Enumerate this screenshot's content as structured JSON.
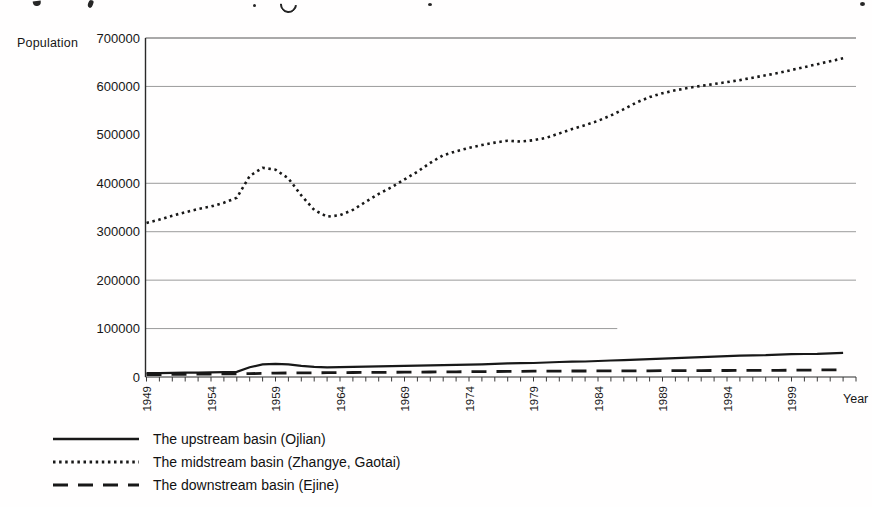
{
  "chart_data": {
    "type": "line",
    "title": "",
    "xlabel": "Year",
    "ylabel": "Population",
    "xlim": [
      1949,
      2004
    ],
    "ylim": [
      0,
      700000
    ],
    "start_year": 1949,
    "y_ticks": [
      0,
      100000,
      200000,
      300000,
      400000,
      500000,
      600000,
      700000
    ],
    "y_tick_labels": [
      "0",
      "100000",
      "200000",
      "300000",
      "400000",
      "500000",
      "600000",
      "700000"
    ],
    "x_tick_label_years": [
      1949,
      1954,
      1959,
      1964,
      1969,
      1974,
      1979,
      1984,
      1989,
      1994,
      1999
    ],
    "x_tick_labels": [
      "1949",
      "1954",
      "1959",
      "1964",
      "1969",
      "1974",
      "1979",
      "1984",
      "1989",
      "1994",
      "1999"
    ],
    "gridlines": [
      {
        "value": 600000
      },
      {
        "value": 400000
      },
      {
        "value": 300000
      },
      {
        "value": 200000
      },
      {
        "value": 100000,
        "end_frac": 0.664
      }
    ],
    "grid_on": true,
    "legend_position": "bottom-left",
    "colors": {
      "line": "#181818",
      "grid": "#9b9b9b",
      "axis": "#2a2a2a",
      "text": "#161616"
    },
    "series": [
      {
        "name": "The upstream basin (Ojlian)",
        "slug": "upstream-basin",
        "style": "solid",
        "values": [
          8000,
          8000,
          8500,
          9000,
          9000,
          9500,
          10000,
          10500,
          20000,
          26000,
          27000,
          26000,
          23000,
          21000,
          20000,
          20500,
          21000,
          21500,
          22000,
          22500,
          23000,
          23500,
          24000,
          24500,
          25000,
          25500,
          26000,
          27000,
          28000,
          28500,
          29000,
          30000,
          31000,
          31500,
          32000,
          33000,
          34000,
          35000,
          36000,
          37000,
          38000,
          39000,
          40000,
          41000,
          42000,
          43000,
          44000,
          44500,
          45000,
          46000,
          47000,
          47500,
          48000,
          49000,
          50000
        ]
      },
      {
        "name": "The midstream basin (Zhangye, Gaotai)",
        "slug": "midstream-basin",
        "style": "dotted",
        "values": [
          318000,
          325000,
          333000,
          340000,
          347000,
          352000,
          360000,
          370000,
          415000,
          432000,
          428000,
          410000,
          375000,
          345000,
          331000,
          334000,
          345000,
          362000,
          378000,
          392000,
          408000,
          424000,
          442000,
          458000,
          466000,
          473000,
          479000,
          484000,
          488000,
          486000,
          489000,
          494000,
          503000,
          512000,
          520000,
          529000,
          540000,
          553000,
          567000,
          578000,
          586000,
          592000,
          597000,
          601000,
          605000,
          609000,
          613000,
          618000,
          623000,
          628000,
          634000,
          640000,
          646000,
          652000,
          658000
        ]
      },
      {
        "name": "The downstream basin (Ejine)",
        "slug": "downstream-basin",
        "style": "dashed",
        "values": [
          5000,
          5100,
          5300,
          5500,
          5800,
          6000,
          6300,
          6600,
          7000,
          7400,
          8000,
          8200,
          8400,
          8600,
          8800,
          9000,
          9200,
          9400,
          9600,
          9800,
          10000,
          10200,
          10400,
          10600,
          10800,
          11000,
          11200,
          11400,
          11600,
          11800,
          12000,
          12100,
          12200,
          12300,
          12400,
          12500,
          12600,
          12700,
          12800,
          12900,
          13000,
          13100,
          13200,
          13300,
          13400,
          13500,
          13600,
          13700,
          13800,
          13900,
          14000,
          14200,
          14500,
          14700,
          15000
        ]
      }
    ]
  }
}
